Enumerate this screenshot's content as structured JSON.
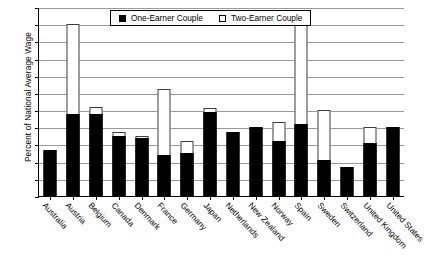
{
  "chart_data": {
    "type": "bar",
    "title": "",
    "xlabel": "",
    "ylabel": "Percent of National Average Wage",
    "ylim": [
      0,
      110
    ],
    "ytick_step": 10,
    "yticks": [
      110,
      100,
      90,
      80,
      70,
      60,
      50,
      40,
      30,
      20,
      10,
      0
    ],
    "grid": true,
    "legend_position": "top-center",
    "categories": [
      "Australia",
      "Austria",
      "Belgium",
      "Canada",
      "Denmark",
      "France",
      "Germany",
      "Japan",
      "Netherlands",
      "New Zealand",
      "Norway",
      "Spain",
      "Sweden",
      "Switzerland",
      "United Kingdom",
      "United States"
    ],
    "series": [
      {
        "name": "One-Earner Couple",
        "style": "filled-black",
        "values": [
          27,
          48,
          48,
          35,
          34,
          24,
          25,
          49,
          37,
          40,
          32,
          42,
          21,
          17,
          31,
          40
        ]
      },
      {
        "name": "Two-Earner Couple",
        "style": "hollow-white",
        "values": [
          27,
          100,
          52,
          37,
          35,
          62,
          32,
          51,
          37,
          40,
          43,
          105,
          50,
          17,
          40,
          40
        ]
      }
    ]
  },
  "legend": {
    "items": [
      {
        "label": "One-Earner Couple",
        "swatch": "filled-square"
      },
      {
        "label": "Two-Earner Couple",
        "swatch": "hollow-square"
      }
    ]
  },
  "colors": {
    "one_earner": "#000000",
    "two_earner": "#ffffff",
    "gridline": "#9a9a9a",
    "axis": "#000000",
    "background": "#ffffff"
  }
}
